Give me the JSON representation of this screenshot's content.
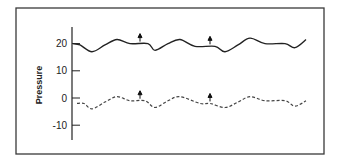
{
  "chart_data": {
    "type": "line",
    "title": "",
    "xlabel": "",
    "ylabel": "Pressure",
    "ylim": [
      -15,
      25
    ],
    "yticks": [
      20,
      10,
      0,
      -10
    ],
    "ytick_labels": [
      "20",
      "10",
      "0",
      "-10"
    ],
    "grid": false,
    "legend": null,
    "series": [
      {
        "name": "upper trace (solid)",
        "style": "solid",
        "x": [
          73,
          80,
          92,
          105,
          117,
          130,
          148,
          155,
          168,
          180,
          195,
          215,
          225,
          238,
          250,
          265,
          285,
          295,
          306
        ],
        "values": [
          20,
          19.5,
          17,
          19.5,
          21.5,
          20,
          20,
          17.5,
          20,
          21.5,
          19,
          19,
          17,
          19.5,
          22,
          20,
          20,
          18.5,
          21.5
        ]
      },
      {
        "name": "lower trace (dashed)",
        "style": "dashed",
        "x": [
          77,
          84,
          92,
          105,
          117,
          130,
          145,
          155,
          168,
          180,
          200,
          210,
          225,
          238,
          250,
          265,
          285,
          295,
          306
        ],
        "values": [
          -2,
          -2,
          -4,
          -1.5,
          0.5,
          -1,
          -1,
          -3.5,
          -1,
          0.5,
          -2,
          -2,
          -3.5,
          -1.5,
          0.5,
          -1,
          -1,
          -3,
          -1
        ]
      }
    ],
    "annotations": [
      {
        "type": "arrow",
        "direction": "up",
        "x": 140,
        "series": "upper trace (solid)"
      },
      {
        "type": "arrow",
        "direction": "up",
        "x": 210,
        "series": "upper trace (solid)"
      },
      {
        "type": "arrow",
        "direction": "up",
        "x": 140,
        "series": "lower trace (dashed)"
      },
      {
        "type": "arrow",
        "direction": "up",
        "x": 210,
        "series": "lower trace (dashed)"
      }
    ]
  }
}
